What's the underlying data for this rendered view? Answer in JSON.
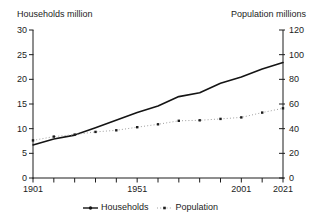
{
  "titles": {
    "left_axis": "Households million",
    "right_axis": "Population millions"
  },
  "legend": {
    "items": [
      {
        "label": "Households",
        "marker": "solid-line-with-dot"
      },
      {
        "label": "Population",
        "marker": "dotted-line-with-square"
      }
    ]
  },
  "colors": {
    "background": "#ffffff",
    "axis": "#1c1c1c",
    "text": "#1c1c1c",
    "households_line": "#141414",
    "population_line": "#a0a0a0",
    "population_marker": "#1c1c1c"
  },
  "chart_data": {
    "type": "line",
    "title": "",
    "xlabel": "",
    "legend_position": "bottom",
    "grid": false,
    "x_axis": {
      "range": [
        1901,
        2021
      ],
      "tick_years": [
        1901,
        1911,
        1921,
        1931,
        1941,
        1951,
        1961,
        1971,
        1981,
        1991,
        2001,
        2011,
        2021
      ],
      "label_years": [
        "1901",
        "1951",
        "2001",
        "2021"
      ]
    },
    "y_left": {
      "label": "Households million",
      "range": [
        0,
        30
      ],
      "ticks": [
        0,
        5,
        10,
        15,
        20,
        25,
        30
      ]
    },
    "y_right": {
      "label": "Population millions",
      "range": [
        0,
        120
      ],
      "ticks": [
        0,
        20,
        40,
        60,
        80,
        100,
        120
      ]
    },
    "series": [
      {
        "name": "Households",
        "axis": "left",
        "style": "solid",
        "x": [
          1901,
          1911,
          1921,
          1931,
          1951,
          1961,
          1971,
          1981,
          1991,
          2001,
          2011,
          2021
        ],
        "values": [
          6.7,
          7.9,
          8.7,
          10.2,
          13.3,
          14.6,
          16.5,
          17.3,
          19.2,
          20.5,
          22.1,
          23.4
        ]
      },
      {
        "name": "Population",
        "axis": "right",
        "style": "dotted-with-markers",
        "x": [
          1901,
          1911,
          1921,
          1931,
          1941,
          1951,
          1961,
          1971,
          1981,
          1991,
          2001,
          2011,
          2021
        ],
        "values": [
          30.5,
          33.6,
          35.2,
          37.4,
          38.7,
          41.2,
          43.5,
          46.4,
          46.8,
          47.9,
          49.1,
          53.0,
          56.5
        ]
      }
    ]
  }
}
